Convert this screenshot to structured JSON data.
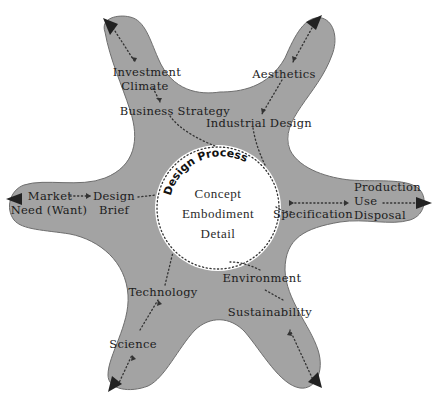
{
  "colors": {
    "background": "#ffffff",
    "star_fill": "#a3a3a3",
    "star_stroke": "#6e6e6e",
    "circle_fill": "#ffffff",
    "text": "#1c1c1c",
    "arrow": "#222222"
  },
  "center": {
    "title": "Design Process",
    "stages": [
      "Concept",
      "Embodiment",
      "Detail"
    ]
  },
  "arms": {
    "top_left": {
      "outer": [
        "Investment",
        "Climate"
      ],
      "inner": "Business Strategy"
    },
    "top_right": {
      "outer": "Aesthetics",
      "inner": "Industrial Design"
    },
    "left": {
      "outer": [
        "Market",
        "Need (Want)"
      ],
      "inner": [
        "Design",
        "Brief"
      ]
    },
    "right": {
      "inner": "Specification",
      "outer": [
        "Production",
        "Use",
        "Disposal"
      ]
    },
    "bottom_left": {
      "inner": "Technology",
      "outer": "Science"
    },
    "bottom_right": {
      "inner": "Environment",
      "outer": "Sustainability"
    }
  }
}
